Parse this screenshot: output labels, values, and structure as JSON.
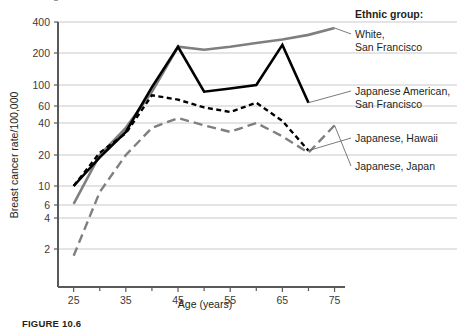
{
  "figure": {
    "caption": "FIGURE 10.6",
    "legend_title": "Ethnic group:"
  },
  "axes": {
    "ylabel": "Breast cancer rate/100,000",
    "xlabel": "Age (years)",
    "ytick_labels": [
      "400",
      "200",
      "100",
      "60",
      "40",
      "20",
      "10",
      "6",
      "4",
      "2",
      "0"
    ],
    "xtick_labels": [
      "25",
      "35",
      "45",
      "55",
      "65",
      "75"
    ]
  },
  "legend": {
    "items": [
      {
        "label_line1": "White,",
        "label_line2": "San Francisco",
        "color": "#7f7f7f",
        "style": "solid"
      },
      {
        "label_line1": "Japanese American,",
        "label_line2": "San Francisco",
        "color": "#000000",
        "style": "solid"
      },
      {
        "label_line1": "Japanese, Hawaii",
        "label_line2": "",
        "color": "#000000",
        "style": "short-dash"
      },
      {
        "label_line1": "Japanese, Japan",
        "label_line2": "",
        "color": "#7f7f7f",
        "style": "long-dash"
      }
    ]
  },
  "colors": {
    "gray_series": "#7f7f7f",
    "black_series": "#000000",
    "gridline": "#c9c9c9",
    "axis": "#58595b",
    "text": "#231f20"
  },
  "chart_data": {
    "type": "line",
    "title": "",
    "xlabel": "Age (years)",
    "ylabel": "Breast cancer rate/100,000",
    "yscale": "log",
    "ylim": [
      1.5,
      400
    ],
    "xlim": [
      22,
      77
    ],
    "grid": true,
    "legend_position": "right",
    "ytick_values": [
      400,
      200,
      100,
      60,
      40,
      20,
      10,
      6,
      4,
      2,
      0
    ],
    "xtick_values": [
      25,
      35,
      45,
      55,
      65,
      75
    ],
    "x_minor_ticks": [
      25,
      30,
      35,
      40,
      45,
      50,
      55,
      60,
      65,
      70,
      75
    ],
    "series": [
      {
        "name": "White, San Francisco",
        "color": "#7f7f7f",
        "style": "solid",
        "x": [
          25,
          30,
          35,
          40,
          45,
          50,
          55,
          60,
          65,
          70,
          75
        ],
        "values": [
          6.2,
          20,
          36,
          85,
          230,
          215,
          230,
          250,
          270,
          300,
          350
        ]
      },
      {
        "name": "Japanese American, San Francisco",
        "color": "#000000",
        "style": "solid",
        "x": [
          25,
          30,
          35,
          40,
          45,
          50,
          55,
          60,
          65,
          70
        ],
        "values": [
          10,
          19,
          33,
          95,
          230,
          85,
          92,
          100,
          240,
          65
        ]
      },
      {
        "name": "Japanese, Hawaii",
        "color": "#000000",
        "style": "short-dash",
        "x": [
          25,
          30,
          35,
          40,
          45,
          50,
          55,
          60,
          65,
          70
        ],
        "values": [
          10,
          21,
          32,
          78,
          70,
          58,
          52,
          65,
          42,
          22
        ]
      },
      {
        "name": "Japanese, Japan",
        "color": "#7f7f7f",
        "style": "long-dash",
        "x": [
          25,
          30,
          35,
          40,
          45,
          50,
          55,
          60,
          65,
          70,
          75
        ],
        "values": [
          1.9,
          8.5,
          20,
          36,
          45,
          38,
          33,
          40,
          30,
          21,
          38
        ]
      }
    ]
  }
}
